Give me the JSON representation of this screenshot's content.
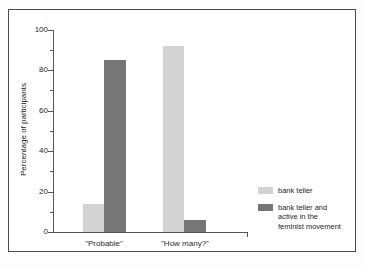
{
  "chart_data": {
    "type": "bar",
    "title": "",
    "subtitle": "",
    "xlabel": "",
    "ylabel": "Percentage of participants",
    "categories": [
      "\"Probable\"",
      "\"How many?\""
    ],
    "series": [
      {
        "name": "bank teller",
        "color": "#d2d2d2",
        "values": [
          14,
          92
        ]
      },
      {
        "name": "bank teller and active in the feminist movement",
        "color": "#767676",
        "values": [
          85,
          6
        ]
      }
    ],
    "ylim": [
      0,
      100
    ],
    "yticks": [
      0,
      20,
      40,
      60,
      80,
      100
    ],
    "ytick_labels": [
      "0",
      "20",
      "40",
      "60",
      "80",
      "100"
    ],
    "yminor_ticks": [
      10,
      30,
      50,
      70,
      90
    ],
    "grid": false,
    "legend_position": "bottom-right"
  },
  "legend": {
    "entries": [
      {
        "label": "bank teller",
        "lines": [
          "bank teller"
        ],
        "color": "#d2d2d2"
      },
      {
        "label": "bank teller and active in the feminist movement",
        "lines": [
          "bank teller and",
          "active in the",
          "feminist movement"
        ],
        "color": "#767676"
      }
    ]
  },
  "axis": {
    "y_title": "Percentage of participants",
    "y_labels": {
      "t0": "0",
      "t20": "20",
      "t40": "40",
      "t60": "60",
      "t80": "80",
      "t100": "100"
    },
    "x_labels": {
      "g1": "\"Probable\"",
      "g2": "\"How many?\""
    }
  },
  "colors": {
    "light_bar": "#d2d2d2",
    "dark_bar": "#767676",
    "axis": "#555555",
    "frame": "#4a4a4a",
    "background": "#ffffff"
  }
}
